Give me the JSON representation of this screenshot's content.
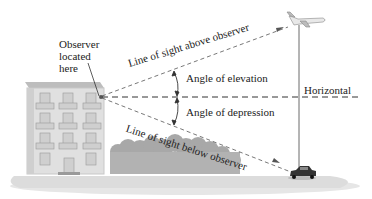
{
  "labels": {
    "observer": "Observer\nlocated\nhere",
    "line_above": "Line of sight above observer",
    "line_below": "Line of sight below observer",
    "angle_elevation": "Angle of elevation",
    "angle_depression": "Angle of depression",
    "horizontal": "Horizontal"
  },
  "objects": {
    "observer_building": "apartment-building",
    "airplane": "airplane",
    "car": "car",
    "trees": "trees"
  },
  "colors": {
    "lines": "#555555",
    "building": "#d8d8d8",
    "trees": "#a9a9a9",
    "ground": "#e2e2e2",
    "text": "#222222"
  }
}
